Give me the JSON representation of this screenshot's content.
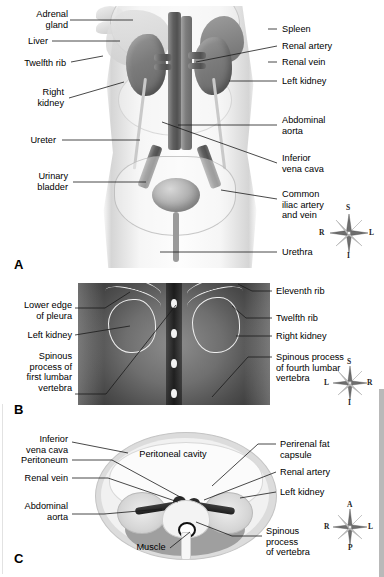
{
  "figure": {
    "panels": [
      {
        "letter": "A",
        "caption": "Anterior view of abdominal organs and vasculature"
      },
      {
        "letter": "B",
        "caption": "Posterior radiograph of the lumbar region"
      },
      {
        "letter": "C",
        "caption": "Transverse cross-section at the level of the kidneys"
      }
    ]
  },
  "panel_a": {
    "letter": "A",
    "labels_left": [
      {
        "id": "adrenal-gland",
        "text": "Adrenal\ngland"
      },
      {
        "id": "liver",
        "text": "Liver"
      },
      {
        "id": "twelfth-rib",
        "text": "Twelfth rib"
      },
      {
        "id": "right-kidney",
        "text": "Right\nkidney"
      },
      {
        "id": "ureter",
        "text": "Ureter"
      },
      {
        "id": "urinary-bladder",
        "text": "Urinary\nbladder"
      }
    ],
    "labels_right": [
      {
        "id": "spleen",
        "text": "Spleen"
      },
      {
        "id": "renal-artery",
        "text": "Renal artery"
      },
      {
        "id": "renal-vein",
        "text": "Renal vein"
      },
      {
        "id": "left-kidney",
        "text": "Left kidney"
      },
      {
        "id": "abdominal-aorta",
        "text": "Abdominal\naorta"
      },
      {
        "id": "inferior-vena-cava",
        "text": "Inferior\nvena cava"
      },
      {
        "id": "common-iliac",
        "text": "Common\niliac artery\nand vein"
      },
      {
        "id": "urethra",
        "text": "Urethra"
      }
    ],
    "compass": {
      "top": "S",
      "bottom": "I",
      "left": "R",
      "right": "L"
    }
  },
  "panel_b": {
    "letter": "B",
    "labels_left": [
      {
        "id": "lower-edge-of-pleura",
        "text": "Lower edge\nof pleura"
      },
      {
        "id": "left-kidney",
        "text": "Left kidney"
      },
      {
        "id": "spinous-process-first-lumbar",
        "text": "Spinous\nprocess of\nfirst lumbar\nvertebra"
      }
    ],
    "labels_right": [
      {
        "id": "eleventh-rib",
        "text": "Eleventh rib"
      },
      {
        "id": "twelfth-rib",
        "text": "Twelfth rib"
      },
      {
        "id": "right-kidney",
        "text": "Right kidney"
      },
      {
        "id": "spinous-process-fourth-lumbar",
        "text": "Spinous process\nof fourth lumbar\nvertebra"
      }
    ],
    "compass": {
      "top": "S",
      "bottom": "I",
      "left": "L",
      "right": "R"
    }
  },
  "panel_c": {
    "letter": "C",
    "labels_left": [
      {
        "id": "inferior-vena-cava",
        "text": "Inferior\nvena cava"
      },
      {
        "id": "peritoneum",
        "text": "Peritoneum"
      },
      {
        "id": "renal-vein",
        "text": "Renal vein"
      },
      {
        "id": "abdominal-aorta",
        "text": "Abdominal\naorta"
      }
    ],
    "labels_right": [
      {
        "id": "perirenal-fat-capsule",
        "text": "Perirenal fat\ncapsule"
      },
      {
        "id": "renal-artery",
        "text": "Renal artery"
      },
      {
        "id": "left-kidney",
        "text": "Left kidney"
      },
      {
        "id": "spinous-process-of-vertebra",
        "text": "Spinous\nprocess\nof vertebra"
      }
    ],
    "labels_inner": [
      {
        "id": "peritoneal-cavity",
        "text": "Peritoneal cavity"
      },
      {
        "id": "muscle",
        "text": "Muscle"
      }
    ],
    "compass": {
      "top": "A",
      "bottom": "P",
      "left": "R",
      "right": "L"
    }
  },
  "colors": {
    "background": "#ffffff",
    "text": "#000000",
    "leader": "#1a1a1a",
    "radiograph_dark": "#3a3a3a",
    "radiograph_light": "#8d8d8d",
    "organ_gray": "#7b7b7b",
    "edge_bar": "#b9b9b9"
  }
}
